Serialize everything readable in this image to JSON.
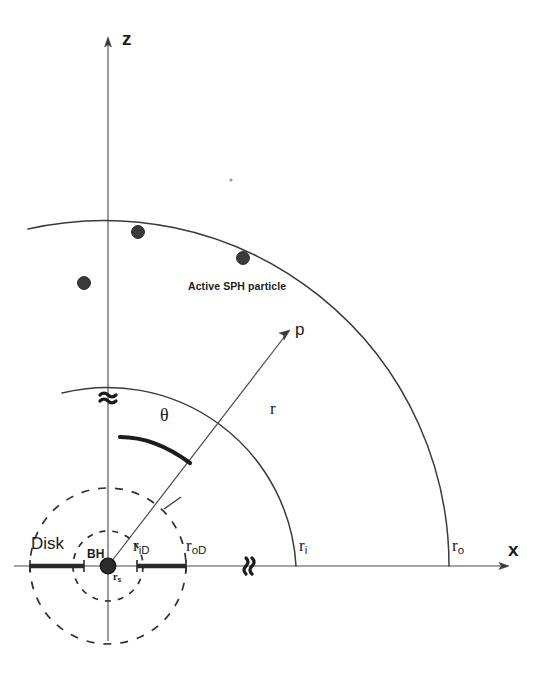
{
  "figure": {
    "background_color": "#ffffff",
    "line_color": "#3a3a3a",
    "ink_color": "#1c1c1c",
    "particle_color": "#3b3b3b"
  },
  "axes": {
    "z_label": "z",
    "x_label": "x",
    "z_break_symbol": "≈",
    "x_break_symbol": "≈"
  },
  "labels": {
    "p_arrow": "p",
    "r_line": "r",
    "theta": "θ",
    "inner_shell": "r",
    "inner_shell_sub": "i",
    "outer_shell": "r",
    "outer_shell_sub": "o",
    "disk": "Disk",
    "black_hole": "BH",
    "schwarzschild": "r",
    "schwarzschild_sub": "s",
    "inner_disk": "r",
    "inner_disk_sub": "iD",
    "outer_disk": "r",
    "outer_disk_sub": "oD",
    "active_particle_caption": "Active SPH particle"
  },
  "particles": [
    {
      "name": "particle-1",
      "cx": 138,
      "cy": 232,
      "r": 6.5
    },
    {
      "name": "particle-2",
      "cx": 243,
      "cy": 258,
      "r": 6.5
    },
    {
      "name": "particle-3",
      "cx": 84,
      "cy": 283,
      "r": 6.5
    },
    {
      "name": "black-hole",
      "cx": 108,
      "cy": 566,
      "r": 8.0
    }
  ],
  "geometry": {
    "origin": {
      "x": 108,
      "y": 566
    },
    "z_axis": {
      "x": 108,
      "top_y": 38,
      "bottom_y": 640
    },
    "x_axis": {
      "y": 566,
      "left_x": 14,
      "right_x": 508
    },
    "outer_arc_radius": 340,
    "inner_arc_radius": 186,
    "dashed_outer_radius": 78,
    "dashed_inner_radius": 35,
    "r_line_end": {
      "x": 290,
      "y": 330
    },
    "theta_arc_radius": 108,
    "disk_bar_left": {
      "x1": 28,
      "x2": 85
    },
    "disk_bar_right": {
      "x1": 137,
      "x2": 186
    }
  }
}
